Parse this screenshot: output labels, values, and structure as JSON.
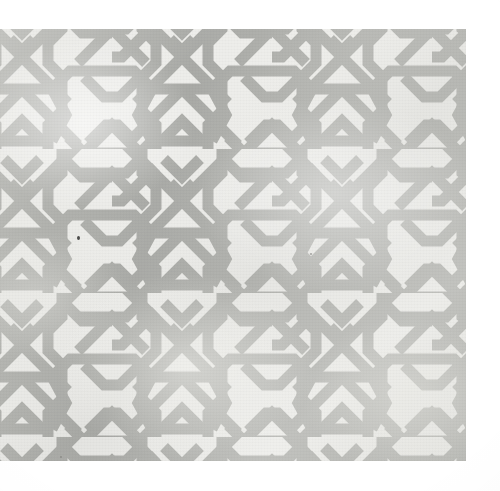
{
  "artwork": {
    "title": "Islamic geometric interlace (strapwork) pattern",
    "medium_note": "Photograph of a printed / woven sheet",
    "description": "Repeating gray ribbon knotwork forming six-pointed star rosettes, hexagonal voids and X crossings over a pale off-white ground",
    "alt_text": "A continuous gray interlaced strapwork lattice of crossing ribbons on an off-white textile ground"
  },
  "colors": {
    "strap": "#a9aaa6",
    "strap_light": "#b8b9b5",
    "strap_dark": "#9a9b97",
    "ground": "#ededea",
    "paper_white": "#ffffff",
    "speck": "#4c4c4a"
  },
  "canvas": {
    "width": 500,
    "height": 491,
    "content_left": 0,
    "content_top": 29,
    "content_width": 466,
    "content_height": 432
  },
  "pattern": {
    "name": "six-point-star-interlace",
    "tile_width": 160,
    "tile_height": 144,
    "strap_width": 11,
    "columns": 4,
    "rows": 4,
    "vertical_band_x": [
      110,
      195,
      275,
      355,
      440
    ],
    "horizontal_band_y": [
      96,
      240,
      384
    ],
    "motif_elements": [
      "vertical-strap",
      "diagonal-strap",
      "x-crossing",
      "hexagonal-void",
      "cusp-arc",
      "chevron-apex"
    ]
  },
  "defects": [
    {
      "name": "ink-speck",
      "x": 77,
      "y": 207,
      "size": 4
    },
    {
      "name": "ink-speck",
      "x": 310,
      "y": 224,
      "size": 2
    },
    {
      "name": "ink-speck",
      "x": 60,
      "y": 456,
      "size": 2
    }
  ]
}
